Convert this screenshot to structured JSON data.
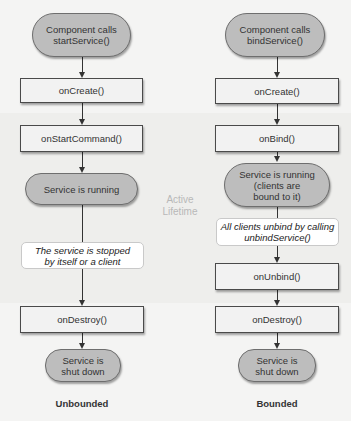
{
  "diagram": {
    "active_lifetime_label": [
      "Active",
      "Lifetime"
    ],
    "unbounded": {
      "caption": "Unbounded",
      "start": [
        "Component calls",
        "startService()"
      ],
      "on_create": "onCreate()",
      "on_start_command": "onStartCommand()",
      "running": "Service is running",
      "stop_note": [
        "The service is stopped",
        "by itself or a client"
      ],
      "on_destroy": "onDestroy()",
      "shut_down": [
        "Service is",
        "shut down"
      ]
    },
    "bounded": {
      "caption": "Bounded",
      "start": [
        "Component calls",
        "bindService()"
      ],
      "on_create": "onCreate()",
      "on_bind": "onBind()",
      "running": [
        "Service is running",
        "(clients are",
        "bound to it)"
      ],
      "unbind_note": [
        "All clients unbind by calling",
        "unbindService()"
      ],
      "on_unbind": "onUnbind()",
      "on_destroy": "onDestroy()",
      "shut_down": [
        "Service is",
        "shut down"
      ]
    },
    "colors": {
      "background": "#f4f4f3",
      "pill_fill": "#bdbdbd",
      "box_fill": "#f2f2f2",
      "note_fill": "#ffffff",
      "active_label": "#b8b8b8"
    }
  }
}
